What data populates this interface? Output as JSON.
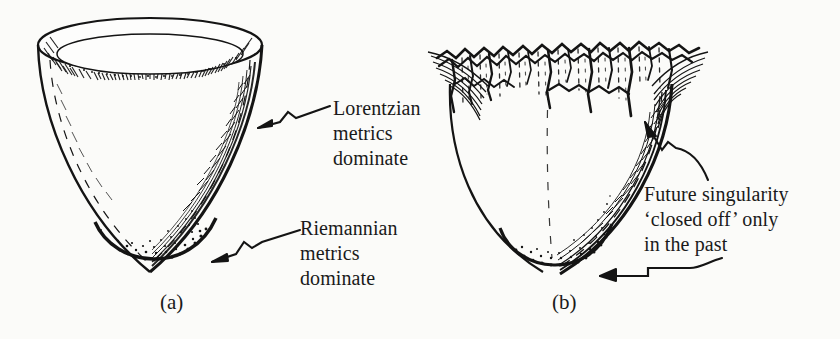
{
  "figure": {
    "background_color": "#fbfbf9",
    "ink_color": "#141414",
    "panels": [
      {
        "id": "a",
        "caption": "(a)",
        "description": "Smooth funnel with elliptical rim; hatched inner rim band, stippled rounded bottom"
      },
      {
        "id": "b",
        "caption": "(b)",
        "description": "Funnel with ragged jagged singularity rim; stippled rounded bottom"
      }
    ],
    "annotations": [
      {
        "id": "lorentzian",
        "lines": [
          "Lorentzian",
          "metrics",
          "dominate"
        ],
        "text": "Lorentzian\nmetrics\ndominate",
        "arrow": "squiggle-arrow-left",
        "points_to": "upper wall of funnel (a)"
      },
      {
        "id": "riemannian",
        "lines": [
          "Riemannian",
          "metrics",
          "dominate"
        ],
        "text": "Riemannian\nmetrics\ndominate",
        "arrow": "squiggle-arrow-left",
        "points_to": "stippled bottom of funnel (a)"
      },
      {
        "id": "future-singularity",
        "lines": [
          "Future singularity",
          "‘closed off’ only",
          "in the past"
        ],
        "text": "Future singularity\n‘closed off’ only\nin the past",
        "arrows": [
          "kinked-arrow-up-left",
          "step-arrow-left"
        ],
        "points_to": "ragged rim of funnel (b) and stippled bottom of funnel (b)"
      }
    ]
  }
}
